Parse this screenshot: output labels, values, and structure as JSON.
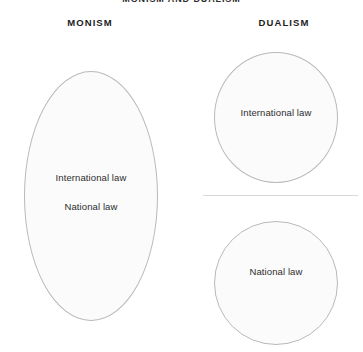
{
  "diagram": {
    "title": "MONISM AND DUALISM",
    "type": "venn-style concept diagram",
    "background_color": "#ffffff",
    "shape_fill_color": "#fbfbfb",
    "shape_stroke_color": "#b9b9b9",
    "divider_color": "#d8d8d8",
    "text_color": "#2e2e2e",
    "header_color": "#1d1d1d"
  },
  "columns": [
    {
      "header": "MONISM",
      "shapes": [
        {
          "shape": "ellipse",
          "labels": [
            "International law",
            "National law"
          ]
        }
      ]
    },
    {
      "header": "DUALISM",
      "shapes": [
        {
          "shape": "circle",
          "labels": [
            "International law"
          ]
        },
        {
          "shape": "circle",
          "labels": [
            "National law"
          ]
        }
      ],
      "divider": true
    }
  ],
  "monism": {
    "header": "MONISM",
    "ellipse": {
      "label_international": "International law",
      "label_national": "National law"
    }
  },
  "dualism": {
    "header": "DUALISM",
    "circle_top": {
      "label": "International law"
    },
    "circle_bottom": {
      "label": "National law"
    }
  }
}
